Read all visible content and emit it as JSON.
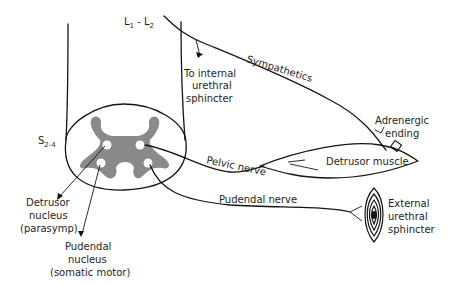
{
  "diagram": {
    "colors": {
      "ink": "#141414",
      "grey_matter": "#8a8a8a",
      "background": "#ffffff"
    },
    "labels": {
      "lumbar": "L1 - L2",
      "lumbar_L": "L",
      "lumbar_1": "1",
      "lumbar_dash": " - L",
      "lumbar_2": "2",
      "sacral_S": "S",
      "sacral_sub": "2-4",
      "sympathetics": "Sympathetics",
      "internal_1": "To internal",
      "internal_2": "urethral",
      "internal_3": "sphincter",
      "adrenergic_1": "Adrenergic",
      "adrenergic_2": "ending",
      "pelvic_nerve": "Pelvic nerve",
      "detrusor_muscle": "Detrusor muscle",
      "pudendal_nerve": "Pudendal nerve",
      "external_1": "External",
      "external_2": "urethral",
      "external_3": "sphincter",
      "detrusor_nucleus_1": "Detrusor",
      "detrusor_nucleus_2": "nucleus",
      "detrusor_nucleus_3": "(parasymp)",
      "pudendal_nucleus_1": "Pudendal",
      "pudendal_nucleus_2": "nucleus",
      "pudendal_nucleus_3": "(somatic motor)"
    }
  }
}
